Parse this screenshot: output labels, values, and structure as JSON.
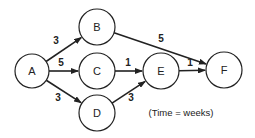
{
  "diagram": {
    "type": "network-activity-graph",
    "caption": "(Time = weeks)",
    "nodes": [
      {
        "id": "A",
        "label": "A",
        "cx": 32,
        "cy": 71,
        "r": 17
      },
      {
        "id": "B",
        "label": "B",
        "cx": 97,
        "cy": 27,
        "r": 18
      },
      {
        "id": "C",
        "label": "C",
        "cx": 97,
        "cy": 71,
        "r": 18
      },
      {
        "id": "D",
        "label": "D",
        "cx": 97,
        "cy": 113,
        "r": 18
      },
      {
        "id": "E",
        "label": "E",
        "cx": 161,
        "cy": 71,
        "r": 18
      },
      {
        "id": "F",
        "label": "F",
        "cx": 224,
        "cy": 70,
        "r": 18
      }
    ],
    "edges": [
      {
        "from": "A",
        "to": "B",
        "weight": "3",
        "lx": 56,
        "ly": 44
      },
      {
        "from": "A",
        "to": "C",
        "weight": "5",
        "lx": 61,
        "ly": 66
      },
      {
        "from": "A",
        "to": "D",
        "weight": "3",
        "lx": 58,
        "ly": 101
      },
      {
        "from": "B",
        "to": "F",
        "weight": "5",
        "lx": 161,
        "ly": 42
      },
      {
        "from": "C",
        "to": "E",
        "weight": "1",
        "lx": 128,
        "ly": 66
      },
      {
        "from": "D",
        "to": "E",
        "weight": "3",
        "lx": 131,
        "ly": 101
      },
      {
        "from": "E",
        "to": "F",
        "weight": "1",
        "lx": 190,
        "ly": 66
      }
    ]
  }
}
